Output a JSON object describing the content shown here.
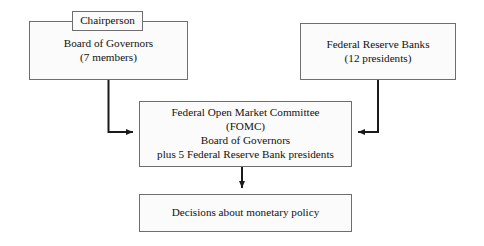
{
  "diagram": {
    "stroke_color": "#6e6e70",
    "fill_color": "#fbfbfb",
    "text_color": "#111111",
    "connector_color": "#1a1a1a",
    "nodes": {
      "chairperson": {
        "label": "Chairperson"
      },
      "board_of_governors": {
        "line1": "Board of Governors",
        "line2": "(7 members)"
      },
      "federal_reserve_banks": {
        "line1": "Federal Reserve Banks",
        "line2": "(12 presidents)"
      },
      "fomc": {
        "line1": "Federal Open Market Committee",
        "line2": "(FOMC)",
        "line3": "Board of Governors",
        "line4": "plus 5 Federal Reserve Bank presidents"
      },
      "decisions": {
        "label": "Decisions about monetary policy"
      }
    },
    "connectors": [
      {
        "name": "board-to-fomc",
        "from": "board_of_governors",
        "to": "fomc",
        "style": "elbow-right-arrow"
      },
      {
        "name": "frb-to-fomc",
        "from": "federal_reserve_banks",
        "to": "fomc",
        "style": "elbow-left-arrow"
      },
      {
        "name": "fomc-to-decisions",
        "from": "fomc",
        "to": "decisions",
        "style": "straight-down-arrow"
      }
    ]
  }
}
